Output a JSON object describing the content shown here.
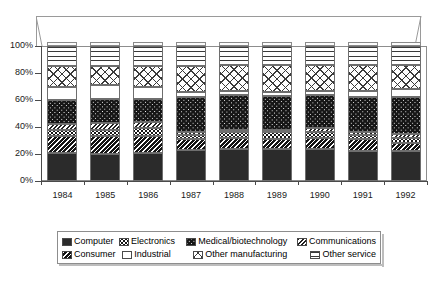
{
  "chart_title": "",
  "axes": {
    "y_ticks": [
      "100%",
      "80%",
      "60%",
      "40%",
      "20%",
      "0%"
    ],
    "x_ticks": [
      "1984",
      "1985",
      "1986",
      "1987",
      "1988",
      "1989",
      "1990",
      "1991",
      "1992"
    ]
  },
  "legend": {
    "row1": [
      {
        "label": "Computer",
        "pattern": "p-computer",
        "name": "computer"
      },
      {
        "label": "Electronics",
        "pattern": "p-electronics",
        "name": "electronics"
      },
      {
        "label": "Medical/biotechnology",
        "pattern": "p-medical",
        "name": "medical-biotechnology"
      },
      {
        "label": "Communications",
        "pattern": "p-communications",
        "name": "communications"
      }
    ],
    "row2": [
      {
        "label": "Consumer",
        "pattern": "p-consumer",
        "name": "consumer"
      },
      {
        "label": "Industrial",
        "pattern": "p-industrial",
        "name": "industrial"
      },
      {
        "label": "Other manufacturing",
        "pattern": "p-othermfg",
        "name": "other-manufacturing"
      },
      {
        "label": "Other service",
        "pattern": "p-otherservice",
        "name": "other-service"
      }
    ]
  },
  "chart_data": {
    "type": "bar",
    "title": "",
    "xlabel": "",
    "ylabel": "",
    "ylim": [
      0,
      100
    ],
    "stacked": true,
    "normalized_percent": true,
    "grid": false,
    "legend_position": "bottom",
    "categories": [
      "1984",
      "1985",
      "1986",
      "1987",
      "1988",
      "1989",
      "1990",
      "1991",
      "1992"
    ],
    "stack_order_bottom_to_top": [
      "Computer",
      "Consumer",
      "Electronics",
      "Communications",
      "Medical/biotechnology",
      "Industrial",
      "Other manufacturing",
      "Other service"
    ],
    "series": [
      {
        "name": "Computer",
        "pattern": "p-computer",
        "values": [
          21,
          20,
          21,
          23,
          24,
          24,
          24,
          22,
          22
        ]
      },
      {
        "name": "Consumer",
        "pattern": "p-consumer",
        "values": [
          12,
          13,
          12,
          8,
          8,
          7,
          8,
          9,
          6
        ]
      },
      {
        "name": "Electronics",
        "pattern": "p-electronics",
        "values": [
          5,
          5,
          6,
          3,
          4,
          5,
          4,
          3,
          4
        ]
      },
      {
        "name": "Communications",
        "pattern": "p-communications",
        "values": [
          4,
          5,
          5,
          2,
          2,
          2,
          3,
          2,
          3
        ]
      },
      {
        "name": "Medical/biotechnology",
        "pattern": "p-medical",
        "values": [
          18,
          18,
          17,
          26,
          26,
          25,
          25,
          26,
          27
        ]
      },
      {
        "name": "Industrial",
        "pattern": "p-industrial",
        "values": [
          10,
          10,
          9,
          4,
          3,
          3,
          3,
          5,
          6
        ]
      },
      {
        "name": "Other manufacturing",
        "pattern": "p-othermfg",
        "values": [
          15,
          14,
          15,
          19,
          19,
          20,
          19,
          19,
          18
        ]
      },
      {
        "name": "Other service",
        "pattern": "p-otherservice",
        "values": [
          15,
          15,
          15,
          15,
          14,
          14,
          14,
          14,
          14
        ]
      }
    ]
  }
}
